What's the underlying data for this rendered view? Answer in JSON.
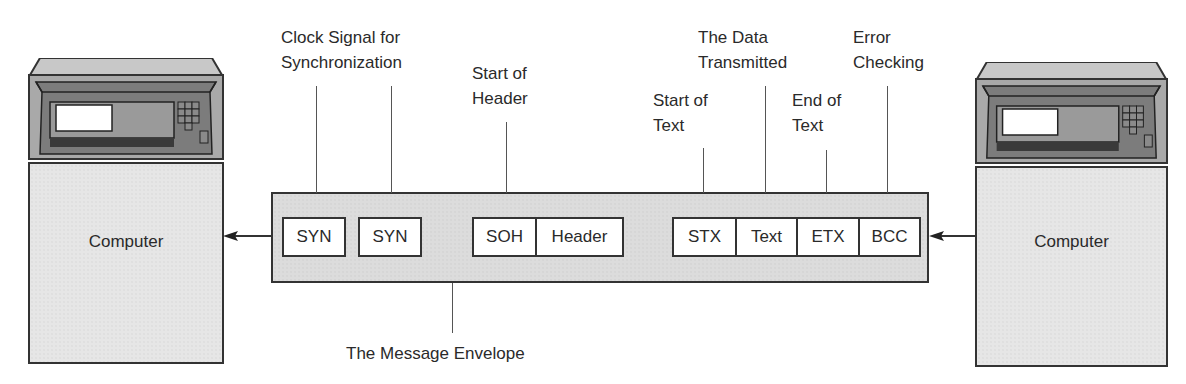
{
  "diagram": {
    "title": "The Message Envelope",
    "left_computer": {
      "label": "Computer"
    },
    "right_computer": {
      "label": "Computer"
    },
    "envelope": {
      "label": "The Message Envelope",
      "fields": [
        {
          "id": "syn1",
          "label": "SYN"
        },
        {
          "id": "syn2",
          "label": "SYN"
        },
        {
          "id": "soh",
          "label": "SOH"
        },
        {
          "id": "header",
          "label": "Header"
        },
        {
          "id": "stx",
          "label": "STX"
        },
        {
          "id": "text",
          "label": "Text"
        },
        {
          "id": "etx",
          "label": "ETX"
        },
        {
          "id": "bcc",
          "label": "BCC"
        }
      ]
    },
    "annotations": {
      "clock": {
        "line1": "Clock Signal for",
        "line2": "Synchronization"
      },
      "soh": {
        "line1": "Start of",
        "line2": "Header"
      },
      "stx": {
        "line1": "Start of",
        "line2": "Text"
      },
      "text": {
        "line1": "The Data",
        "line2": "Transmitted"
      },
      "etx": {
        "line1": "End of",
        "line2": "Text"
      },
      "bcc": {
        "line1": "Error",
        "line2": "Checking"
      }
    },
    "flow_direction": "right-to-left",
    "colors": {
      "outline": "#333333",
      "panel_fill": "#dcdcdc",
      "field_fill": "#ffffff",
      "monitor_dark": "#7a7a7a"
    }
  }
}
